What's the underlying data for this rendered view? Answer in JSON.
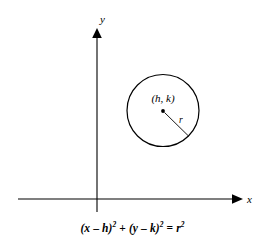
{
  "figure": {
    "background_color": "#ffffff",
    "stroke_color": "#000000",
    "axes": {
      "x_label": "x",
      "y_label": "y",
      "origin": {
        "x": 97,
        "y": 199
      }
    },
    "circle": {
      "center_label_open": "(",
      "center_label_h": "h",
      "center_label_comma": ", ",
      "center_label_k": "k",
      "center_label_close": ")",
      "center_label": "(h, k)",
      "radius_label": "r",
      "center_x": 163,
      "center_y": 110.5,
      "radius_px": 36
    },
    "equation": {
      "part_open": "(",
      "x_var": "x",
      "minus_1": " – ",
      "h_var": "h",
      "close_1": ")",
      "exp_1": "2",
      "plus": " + ",
      "open_2": "(",
      "y_var": "y",
      "minus_2": " – ",
      "k_var": "k",
      "close_2": ")",
      "exp_2": "2",
      "equals": " = ",
      "r_var": "r",
      "exp_3": "2",
      "full_text": "(x – h)2 + (y – k)2 = r2"
    }
  }
}
